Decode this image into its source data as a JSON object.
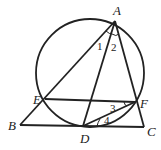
{
  "diagram": {
    "points": {
      "A": {
        "label": "A",
        "x": 115,
        "y": 20
      },
      "B": {
        "label": "B",
        "x": 20,
        "y": 125
      },
      "C": {
        "label": "C",
        "x": 145,
        "y": 127
      },
      "D": {
        "label": "D",
        "x": 83,
        "y": 126
      },
      "E": {
        "label": "E",
        "x": 45,
        "y": 100
      },
      "F": {
        "label": "F",
        "x": 135,
        "y": 102
      }
    },
    "angles": {
      "a1": "1",
      "a2": "2",
      "a3": "3",
      "a4": "4"
    },
    "circle": {
      "cx": 90,
      "cy": 72,
      "r": 53
    }
  }
}
